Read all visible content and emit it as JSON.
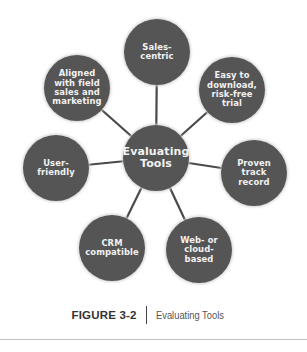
{
  "diagram": {
    "type": "hub-and-spoke",
    "colors": {
      "node_fill": "#555555",
      "node_text": "#f2f2f2",
      "connector": "#4a4a4a"
    },
    "center": {
      "label": "Evaluating Tools",
      "lines": [
        "Evaluating",
        "Tools"
      ]
    },
    "nodes": [
      {
        "id": "sales-centric",
        "lines": [
          "Sales-",
          "centric"
        ]
      },
      {
        "id": "easy-to-download",
        "lines": [
          "Easy to",
          "download,",
          "risk-free",
          "trial"
        ]
      },
      {
        "id": "proven",
        "lines": [
          "Proven",
          "track record"
        ]
      },
      {
        "id": "web-or-cloud",
        "lines": [
          "Web- or",
          "cloud-based"
        ]
      },
      {
        "id": "crm-compatible",
        "lines": [
          "CRM",
          "compatible"
        ]
      },
      {
        "id": "user-friendly",
        "lines": [
          "User-",
          "friendly"
        ]
      },
      {
        "id": "aligned",
        "lines": [
          "Aligned",
          "with field",
          "sales and",
          "marketing"
        ]
      }
    ]
  },
  "caption": {
    "figure_number": "FIGURE 3-2",
    "title": "Evaluating Tools"
  }
}
